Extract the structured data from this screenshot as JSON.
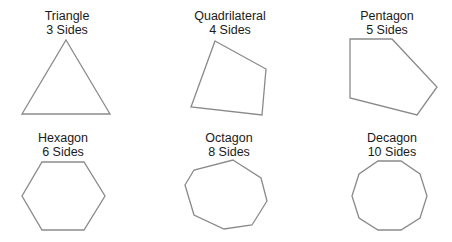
{
  "stroke_color": "#8a8a8a",
  "shapes": [
    {
      "name": "Triangle",
      "sides_label": "3 Sides",
      "sides": 3,
      "points": "66,40 110,114 22,114",
      "label_x": 67
    },
    {
      "name": "Quadrilateral",
      "sides_label": "4 Sides",
      "sides": 4,
      "points": "215,41 266,69 262,115 191,107",
      "label_x": 230
    },
    {
      "name": "Pentagon",
      "sides_label": "5 Sides",
      "sides": 5,
      "points": "350,39 392,39 437,87 417,115 350,98",
      "label_x": 387
    },
    {
      "name": "Hexagon",
      "sides_label": "6 Sides",
      "sides": 6,
      "points": "42,162 84,162 105,196 84,230 42,230 22,196",
      "label_x": 63
    },
    {
      "name": "Octagon",
      "sides_label": "8 Sides",
      "sides": 8,
      "points": "233,160 261,178 267,201 252,225 224,229 194,215 185,185 194,170",
      "label_x": 229
    },
    {
      "name": "Decagon",
      "sides_label": "10 Sides",
      "sides": 10,
      "points": "378,161 401,161 420,174 427,196 420,218 401,230 378,230 359,218 352,196 359,174",
      "label_x": 392
    }
  ]
}
